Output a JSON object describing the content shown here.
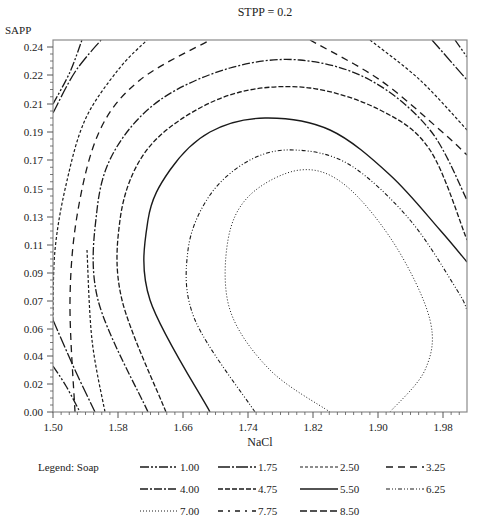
{
  "chart_data": {
    "type": "contour",
    "title": "STPP = 0.2",
    "xlabel": "NaCl",
    "ylabel": "SAPP",
    "xlim": [
      1.5,
      2.01
    ],
    "ylim": [
      0.0,
      0.245
    ],
    "x_ticks": [
      "1.50",
      "1.58",
      "1.66",
      "1.74",
      "1.82",
      "1.90",
      "1.98"
    ],
    "y_ticks": [
      "0.24",
      "0.22",
      "0.21",
      "0.19",
      "0.17",
      "0.15",
      "0.13",
      "0.11",
      "0.09",
      "0.07",
      "0.06",
      "0.04",
      "0.02",
      "0.00"
    ],
    "grid": false,
    "legend_position": "bottom",
    "legend_title": "Legend: Soap",
    "legend": [
      {
        "label": "1.00",
        "style": "longdash-dot-dot"
      },
      {
        "label": "1.75",
        "style": "long-dash-short"
      },
      {
        "label": "2.50",
        "style": "short-dash"
      },
      {
        "label": "3.25",
        "style": "dash"
      },
      {
        "label": "4.00",
        "style": "dash-dot"
      },
      {
        "label": "4.75",
        "style": "medium-dash"
      },
      {
        "label": "5.50",
        "style": "solid"
      },
      {
        "label": "6.25",
        "style": "dash-dot-dot"
      },
      {
        "label": "7.00",
        "style": "dotted"
      },
      {
        "label": "7.75",
        "style": "sparse-dash-dot"
      },
      {
        "label": "8.50",
        "style": "long-dash"
      }
    ],
    "contours": [
      {
        "level": 1.0,
        "segments": [
          [
            [
              53,
              104
            ],
            [
              70,
              72
            ],
            [
              82,
              40
            ]
          ],
          [
            [
              53,
              366
            ],
            [
              66,
              386
            ],
            [
              80,
              412
            ]
          ],
          [
            [
              455,
              40
            ],
            [
              467,
              57
            ]
          ]
        ]
      },
      {
        "level": 1.75,
        "segments": [
          [
            [
              53,
              113
            ],
            [
              75,
              72
            ],
            [
              101,
              40
            ]
          ],
          [
            [
              53,
              320
            ],
            [
              75,
              370
            ],
            [
              95,
              412
            ]
          ],
          [
            [
              432,
              40
            ],
            [
              467,
              80
            ]
          ]
        ]
      },
      {
        "level": 2.5,
        "segments": [
          [
            [
              53,
              320
            ],
            [
              55,
              250
            ],
            [
              66,
              185
            ],
            [
              85,
              120
            ],
            [
              118,
              70
            ],
            [
              147,
              40
            ]
          ],
          [
            [
              87,
              250
            ],
            [
              92,
              340
            ],
            [
              105,
              412
            ]
          ],
          [
            [
              370,
              40
            ],
            [
              420,
              80
            ],
            [
              467,
              130
            ]
          ]
        ]
      },
      {
        "level": 3.25,
        "segments": [
          [
            [
              75,
              412
            ],
            [
              70,
              300
            ],
            [
              78,
              210
            ],
            [
              100,
              130
            ],
            [
              140,
              80
            ],
            [
              210,
              40
            ]
          ],
          [
            [
              310,
              40
            ],
            [
              380,
              80
            ],
            [
              440,
              130
            ],
            [
              467,
              155
            ]
          ]
        ]
      },
      {
        "level": 4.0,
        "segments": [
          [
            [
              148,
              412
            ],
            [
              98,
              300
            ],
            [
              97,
              210
            ],
            [
              115,
              150
            ],
            [
              160,
              100
            ],
            [
              230,
              68
            ],
            [
              300,
              60
            ],
            [
              370,
              80
            ],
            [
              430,
              130
            ],
            [
              467,
              200
            ]
          ]
        ]
      },
      {
        "level": 4.75,
        "segments": [
          [
            [
              166,
              412
            ],
            [
              122,
              300
            ],
            [
              120,
              220
            ],
            [
              140,
              160
            ],
            [
              180,
              120
            ],
            [
              240,
              92
            ],
            [
              310,
              88
            ],
            [
              380,
              110
            ],
            [
              430,
              150
            ],
            [
              467,
              240
            ]
          ]
        ]
      },
      {
        "level": 5.5,
        "segments": [
          [
            [
              210,
              412
            ],
            [
              150,
              300
            ],
            [
              148,
              220
            ],
            [
              170,
              170
            ],
            [
              210,
              132
            ],
            [
              265,
              118
            ],
            [
              330,
              130
            ],
            [
              390,
              175
            ],
            [
              440,
              230
            ],
            [
              467,
              262
            ]
          ]
        ]
      },
      {
        "level": 6.25,
        "segments": [
          [
            [
              255,
              412
            ],
            [
              195,
              320
            ],
            [
              188,
              250
            ],
            [
              210,
              195
            ],
            [
              250,
              160
            ],
            [
              295,
              150
            ],
            [
              350,
              165
            ],
            [
              410,
              220
            ],
            [
              457,
              290
            ],
            [
              467,
              310
            ]
          ]
        ]
      },
      {
        "level": 7.0,
        "segments": [
          [
            [
              330,
              412
            ],
            [
              270,
              370
            ],
            [
              230,
              310
            ],
            [
              228,
              240
            ],
            [
              250,
              195
            ],
            [
              300,
              170
            ],
            [
              345,
              185
            ],
            [
              395,
              245
            ],
            [
              430,
              320
            ],
            [
              425,
              370
            ],
            [
              390,
              412
            ]
          ]
        ]
      }
    ]
  }
}
